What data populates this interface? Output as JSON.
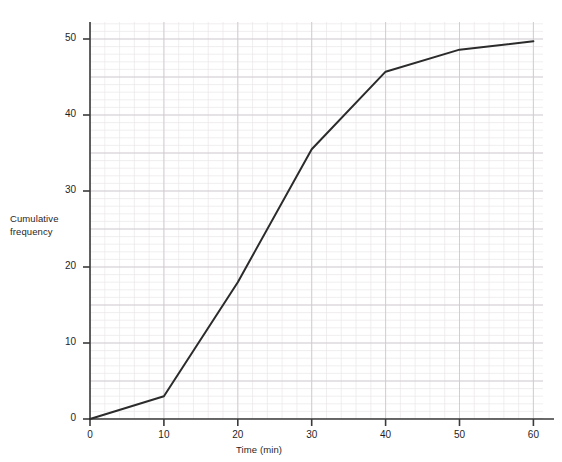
{
  "chart_data": {
    "type": "line",
    "title": "",
    "subtitle": "",
    "xlabel": "Time (min)",
    "ylabel": "Cumulative frequency",
    "ylabel_line1": "Cumulative",
    "ylabel_line2": "frequency",
    "x": [
      0,
      10,
      20,
      30,
      40,
      50,
      60
    ],
    "values": [
      0,
      3,
      18,
      35.5,
      45.7,
      48.6,
      49.7
    ],
    "series": [
      {
        "name": "Cumulative frequency",
        "points": [
          {
            "x": 0,
            "y": 0
          },
          {
            "x": 10,
            "y": 3
          },
          {
            "x": 20,
            "y": 18
          },
          {
            "x": 30,
            "y": 35.5
          },
          {
            "x": 40,
            "y": 45.7
          },
          {
            "x": 50,
            "y": 48.6
          },
          {
            "x": 60,
            "y": 49.7
          }
        ]
      }
    ],
    "xlim": [
      0,
      64
    ],
    "ylim": [
      0,
      53
    ],
    "xticks": [
      0,
      10,
      20,
      30,
      40,
      50,
      60
    ],
    "xtick_labels": [
      "0",
      "10",
      "20",
      "30",
      "40",
      "50",
      "60"
    ],
    "yticks": [
      0,
      10,
      20,
      30,
      40,
      50
    ],
    "ytick_labels": [
      "0",
      "10",
      "20",
      "30",
      "40",
      "50"
    ],
    "grid": true,
    "grid_style": "graph-paper",
    "grid_minor_step_x": 2,
    "grid_minor_step_y": 1,
    "grid_major_step_x": 10,
    "grid_major_step_y": 5,
    "legend": "none",
    "line_color": "#2b2b2b",
    "grid_minor_color": "#ebe6ea",
    "grid_major_color": "#cfc9cf",
    "axis_color": "#3a3a3a",
    "background": "#ffffff"
  },
  "artifact": {
    "top_text": "· · · · · · · · · ·"
  }
}
